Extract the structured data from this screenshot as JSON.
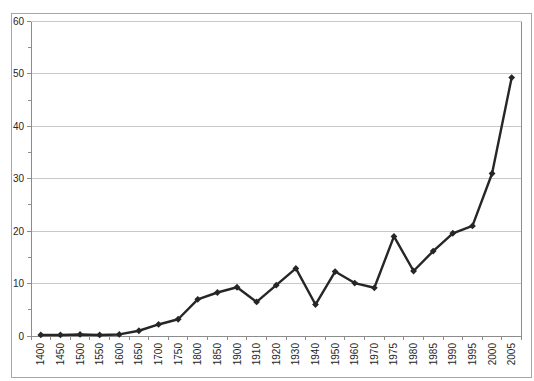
{
  "chart_data": {
    "type": "line",
    "title": "",
    "xlabel": "",
    "ylabel": "",
    "categories": [
      "1400",
      "1450",
      "1500",
      "1550",
      "1600",
      "1650",
      "1700",
      "1750",
      "1800",
      "1850",
      "1900",
      "1910",
      "1920",
      "1930",
      "1940",
      "1950",
      "1960",
      "1970",
      "1975",
      "1980",
      "1985",
      "1990",
      "1995",
      "2000",
      "2005"
    ],
    "values": [
      0.2,
      0.2,
      0.3,
      0.2,
      0.3,
      1.0,
      2.2,
      3.2,
      7.0,
      8.3,
      9.3,
      6.5,
      9.7,
      12.9,
      6.0,
      12.3,
      10.1,
      9.2,
      19.0,
      12.4,
      16.2,
      19.6,
      21.0,
      31.0,
      49.3
    ],
    "ylim": [
      0,
      60
    ],
    "yticks": [
      0,
      10,
      20,
      30,
      40,
      50,
      60
    ],
    "y_minor_tick_interval": 5,
    "grid": true,
    "legend": false,
    "marker": "diamond",
    "x_labels_rotated_degrees": -90,
    "colors": {
      "line": "#262626",
      "marker": "#262626",
      "gridline": "#c9c9c9",
      "axis": "#8c8c8c",
      "tick_label": "#262626",
      "chart_border": "#a6a6a6",
      "background": "#ffffff"
    }
  }
}
